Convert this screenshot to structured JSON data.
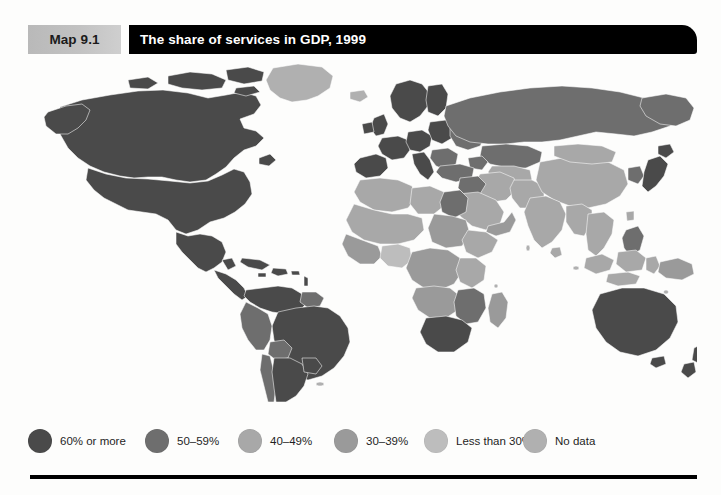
{
  "page": {
    "background_color": "#fdfdfc"
  },
  "header": {
    "map_number": "Map 9.1",
    "title": "The share of services in GDP, 1999",
    "number_box_color": "#c2c2c2",
    "title_bar_color": "#000000",
    "title_text_color": "#ffffff"
  },
  "legend": {
    "items": [
      {
        "label": "60% or more",
        "color": "#4a4a4a",
        "x": 0
      },
      {
        "label": "50–59%",
        "color": "#6e6e6e",
        "x": 117
      },
      {
        "label": "40–49%",
        "color": "#a8a8a8",
        "x": 210
      },
      {
        "label": "30–39%",
        "color": "#9a9a9a",
        "x": 306
      },
      {
        "label": "Less than 30%",
        "color": "#bdbdbd",
        "x": 396
      },
      {
        "label": "No data",
        "color": "#b0b0b0",
        "x": 495
      }
    ]
  },
  "map": {
    "projection": "world-equirectangular",
    "border_color": "#ffffff",
    "ocean_color": "#ffffff",
    "colors": {
      "c60_or_more": "#4a4a4a",
      "c50_59": "#6e6e6e",
      "c40_49": "#a8a8a8",
      "c30_39": "#9a9a9a",
      "less_than_30": "#bdbdbd",
      "no_data": "#b0b0b0"
    },
    "regions": [
      {
        "name": "Canada",
        "category": "60% or more"
      },
      {
        "name": "United States",
        "category": "60% or more"
      },
      {
        "name": "Alaska",
        "category": "60% or more"
      },
      {
        "name": "Greenland",
        "category": "No data"
      },
      {
        "name": "Mexico",
        "category": "60% or more"
      },
      {
        "name": "Central America",
        "category": "60% or more"
      },
      {
        "name": "Caribbean",
        "category": "60% or more"
      },
      {
        "name": "Colombia",
        "category": "60% or more"
      },
      {
        "name": "Venezuela",
        "category": "60% or more"
      },
      {
        "name": "Brazil",
        "category": "60% or more"
      },
      {
        "name": "Peru",
        "category": "50–59%"
      },
      {
        "name": "Bolivia",
        "category": "50–59%"
      },
      {
        "name": "Chile",
        "category": "50–59%"
      },
      {
        "name": "Argentina",
        "category": "60% or more"
      },
      {
        "name": "Uruguay",
        "category": "60% or more"
      },
      {
        "name": "Paraguay",
        "category": "60% or more"
      },
      {
        "name": "Western Europe",
        "category": "60% or more"
      },
      {
        "name": "Scandinavia",
        "category": "60% or more"
      },
      {
        "name": "United Kingdom",
        "category": "60% or more"
      },
      {
        "name": "Iberia",
        "category": "60% or more"
      },
      {
        "name": "Italy",
        "category": "60% or more"
      },
      {
        "name": "Poland",
        "category": "60% or more"
      },
      {
        "name": "Eastern Europe",
        "category": "50–59%"
      },
      {
        "name": "Russia",
        "category": "50–59%"
      },
      {
        "name": "Ukraine",
        "category": "50–59%"
      },
      {
        "name": "Turkey",
        "category": "50–59%"
      },
      {
        "name": "Kazakhstan",
        "category": "50–59%"
      },
      {
        "name": "Central Asia",
        "category": "40–49%"
      },
      {
        "name": "Iran",
        "category": "40–49%"
      },
      {
        "name": "Saudi Arabia",
        "category": "40–49%"
      },
      {
        "name": "Egypt",
        "category": "50–59%"
      },
      {
        "name": "North Africa",
        "category": "40–49%"
      },
      {
        "name": "Sahel",
        "category": "40–49%"
      },
      {
        "name": "West Africa",
        "category": "30–39%"
      },
      {
        "name": "Nigeria",
        "category": "Less than 30%"
      },
      {
        "name": "Central Africa",
        "category": "30–39%"
      },
      {
        "name": "East Africa",
        "category": "40–49%"
      },
      {
        "name": "Southern Africa",
        "category": "50–59%"
      },
      {
        "name": "South Africa",
        "category": "60% or more"
      },
      {
        "name": "India",
        "category": "40–49%"
      },
      {
        "name": "China",
        "category": "40–49%"
      },
      {
        "name": "Mongolia",
        "category": "40–49%"
      },
      {
        "name": "Japan",
        "category": "60% or more"
      },
      {
        "name": "Korea",
        "category": "50–59%"
      },
      {
        "name": "Southeast Asia",
        "category": "40–49%"
      },
      {
        "name": "Indonesia",
        "category": "40–49%"
      },
      {
        "name": "Philippines",
        "category": "50–59%"
      },
      {
        "name": "Papua New Guinea",
        "category": "40–49%"
      },
      {
        "name": "Australia",
        "category": "60% or more"
      },
      {
        "name": "New Zealand",
        "category": "60% or more"
      }
    ]
  },
  "footer": {
    "rule_color": "#000000"
  }
}
